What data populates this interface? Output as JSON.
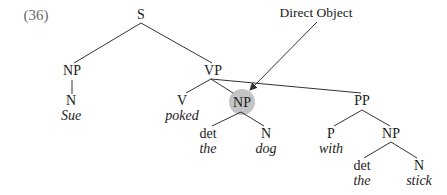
{
  "example_number": "(36)",
  "annotation": "Direct Object",
  "colors": {
    "line": "#333333",
    "highlight": "#c4c4c4",
    "text": "#1a1a1a"
  },
  "tree": {
    "S": "S",
    "subject_np": {
      "label": "NP",
      "n": "N",
      "word": "Sue"
    },
    "vp": {
      "label": "VP",
      "v": {
        "label": "V",
        "word": "poked"
      },
      "object_np": {
        "label": "NP",
        "det": {
          "label": "det",
          "word": "the"
        },
        "n": {
          "label": "N",
          "word": "dog"
        }
      },
      "pp": {
        "label": "PP",
        "p": {
          "label": "P",
          "word": "with"
        },
        "np": {
          "label": "NP",
          "det": {
            "label": "det",
            "word": "the"
          },
          "n": {
            "label": "N",
            "word": "stick"
          }
        }
      }
    }
  }
}
